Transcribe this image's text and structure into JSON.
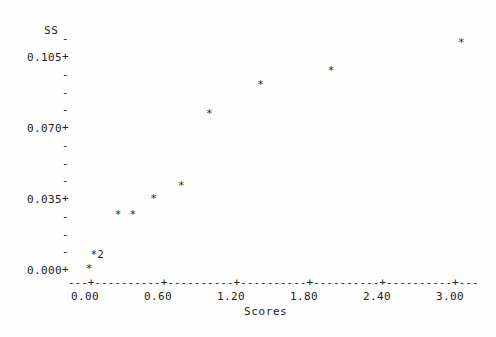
{
  "chart_data": {
    "type": "scatter",
    "title": "",
    "xlabel": "Scores",
    "ylabel": "SS",
    "xlim": [
      -0.18,
      3.17
    ],
    "ylim": [
      -0.009,
      0.1228
    ],
    "grid": false,
    "legend": null,
    "point_marker": "*",
    "x_ticks": [
      "0.00",
      "0.60",
      "1.20",
      "1.80",
      "2.40",
      "3.00"
    ],
    "x_tick_values": [
      0.0,
      0.6,
      1.2,
      1.8,
      2.4,
      3.0
    ],
    "y_ticks": [
      "0.105",
      "0.070",
      "0.035",
      "0.000"
    ],
    "y_tick_values": [
      0.105,
      0.07,
      0.035,
      0.0
    ],
    "y_minor_ticks_per_interval": 3,
    "points": [
      {
        "x": 0.03,
        "y": 0.0005,
        "label": "*",
        "count": 1
      },
      {
        "x": 0.07,
        "y": 0.0075,
        "label": "*2",
        "count": 2
      },
      {
        "x": 0.27,
        "y": 0.027,
        "label": "*",
        "count": 1
      },
      {
        "x": 0.39,
        "y": 0.027,
        "label": "*",
        "count": 1
      },
      {
        "x": 0.56,
        "y": 0.035,
        "label": "*",
        "count": 1
      },
      {
        "x": 0.79,
        "y": 0.0415,
        "label": "*",
        "count": 1
      },
      {
        "x": 1.02,
        "y": 0.077,
        "label": "*",
        "count": 1
      },
      {
        "x": 1.44,
        "y": 0.091,
        "label": "*",
        "count": 1
      },
      {
        "x": 2.02,
        "y": 0.098,
        "label": "*",
        "count": 1
      },
      {
        "x": 3.09,
        "y": 0.112,
        "label": "*",
        "count": 1
      }
    ],
    "total_plotted_observations": 11,
    "axis_line_style": "dashed-with-plus-ticks"
  },
  "axes": {
    "y_title": "SS",
    "x_title": "Scores"
  }
}
